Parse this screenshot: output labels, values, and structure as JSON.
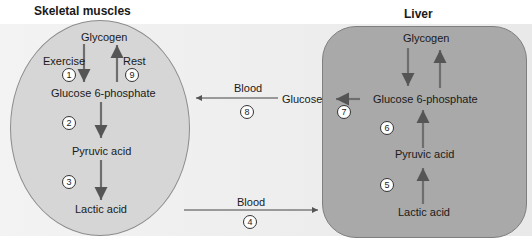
{
  "titles": {
    "muscle": "Skeletal muscles",
    "liver": "Liver"
  },
  "muscle": {
    "glycogen": "Glycogen",
    "exercise": "Exercise",
    "rest": "Rest",
    "g6p": "Glucose 6-phosphate",
    "pyruvic": "Pyruvic acid",
    "lactic": "Lactic acid"
  },
  "liver": {
    "glycogen": "Glycogen",
    "g6p": "Glucose 6-phosphate",
    "pyruvic": "Pyruvic acid",
    "lactic": "Lactic acid"
  },
  "between": {
    "blood_top": "Blood",
    "glucose": "Glucose",
    "blood_bottom": "Blood"
  },
  "steps": [
    "1",
    "2",
    "3",
    "4",
    "5",
    "6",
    "7",
    "8",
    "9"
  ],
  "colors": {
    "arrow": "#6e6e6e",
    "muscle_fill": "#d6d6d6",
    "liver_fill": "#a9a9a9"
  }
}
